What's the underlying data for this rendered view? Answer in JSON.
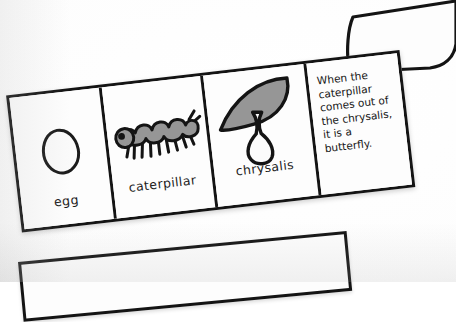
{
  "document": {
    "kind": "scanned-worksheet-photo",
    "subject": "butterfly-life-cycle-foldable-strip"
  },
  "strip": {
    "panels": [
      {
        "id": "egg",
        "label": "egg",
        "art": "egg-oval-icon",
        "art_fill": "#fafafa",
        "art_outline": "#1b1b1b"
      },
      {
        "id": "caterpillar",
        "label": "caterpillar",
        "art": "caterpillar-icon",
        "art_fill": "#969696",
        "art_outline": "#141414"
      },
      {
        "id": "chrysalis",
        "label": "chrysalis",
        "art": "chrysalis-on-leaf-icon",
        "art_fill": "#969696",
        "art_outline": "#141414"
      },
      {
        "id": "butterfly-text",
        "label": "",
        "art": "handwriting-text",
        "text_lines": [
          "When the",
          "caterpillar",
          "comes out of",
          "the chrysalis,",
          "it is a",
          "butterfly."
        ],
        "text_full": "When the caterpillar comes out of the chrysalis, it is a butterfly."
      }
    ]
  },
  "flap": {
    "name": "curled-paper-flap",
    "outline": "#141414",
    "fill": "#fdfdfd"
  },
  "bottom_strip": {
    "name": "second-paper-strip-edge",
    "outline": "#141414",
    "fill": "#fdfdfd"
  },
  "colors": {
    "paper": "#fdfdfd",
    "ink": "#141414",
    "gray_fill": "#969696",
    "page_background": "#f1f1f1"
  }
}
